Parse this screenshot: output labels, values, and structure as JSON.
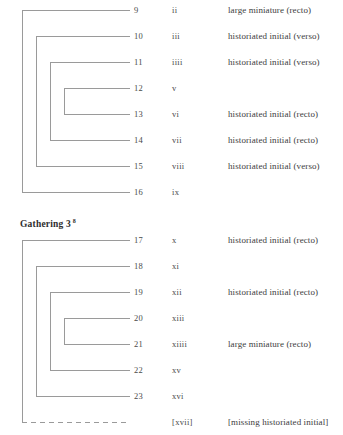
{
  "page": {
    "kind": "manuscript-collation-diagram",
    "line_color": "#9a9a9a",
    "text_color": "#3d3d3d",
    "background": "#ffffff"
  },
  "columns": {
    "folio_header": "",
    "roman_header": "",
    "note_header": ""
  },
  "gatherings": [
    {
      "id": "gathering-2",
      "heading": "Gathering 2",
      "heading_superscript": "8",
      "heading_visible": false,
      "leaves": [
        {
          "folio": "9",
          "roman": "ii",
          "note": "large miniature (recto)"
        },
        {
          "folio": "10",
          "roman": "iii",
          "note": "historiated initial (verso)"
        },
        {
          "folio": "11",
          "roman": "iiii",
          "note": "historiated initial (verso)"
        },
        {
          "folio": "12",
          "roman": "v",
          "note": ""
        },
        {
          "folio": "13",
          "roman": "vi",
          "note": "historiated initial (recto)"
        },
        {
          "folio": "14",
          "roman": "vii",
          "note": "historiated initial (recto)"
        },
        {
          "folio": "15",
          "roman": "viii",
          "note": "historiated initial (verso)"
        },
        {
          "folio": "16",
          "roman": "ix",
          "note": ""
        }
      ],
      "bifolia": [
        {
          "top_leaf": 0,
          "bottom_leaf": 7,
          "missing": false
        },
        {
          "top_leaf": 1,
          "bottom_leaf": 6,
          "missing": false
        },
        {
          "top_leaf": 2,
          "bottom_leaf": 5,
          "missing": false
        },
        {
          "top_leaf": 3,
          "bottom_leaf": 4,
          "missing": false
        }
      ]
    },
    {
      "id": "gathering-3",
      "heading": "Gathering 3",
      "heading_superscript": "8",
      "heading_visible": true,
      "leaves": [
        {
          "folio": "17",
          "roman": "x",
          "note": "historiated initial (recto)"
        },
        {
          "folio": "18",
          "roman": "xi",
          "note": ""
        },
        {
          "folio": "19",
          "roman": "xii",
          "note": "historiated initial (recto)"
        },
        {
          "folio": "20",
          "roman": "xiii",
          "note": ""
        },
        {
          "folio": "21",
          "roman": "xiiii",
          "note": "large miniature (recto)"
        },
        {
          "folio": "22",
          "roman": "xv",
          "note": ""
        },
        {
          "folio": "23",
          "roman": "xvi",
          "note": ""
        },
        {
          "folio": "",
          "roman": "[xvii]",
          "note": "[missing historiated initial]"
        }
      ],
      "bifolia": [
        {
          "top_leaf": 0,
          "bottom_leaf": 7,
          "missing": true
        },
        {
          "top_leaf": 1,
          "bottom_leaf": 6,
          "missing": false
        },
        {
          "top_leaf": 2,
          "bottom_leaf": 5,
          "missing": false
        },
        {
          "top_leaf": 3,
          "bottom_leaf": 4,
          "missing": false
        }
      ]
    }
  ]
}
